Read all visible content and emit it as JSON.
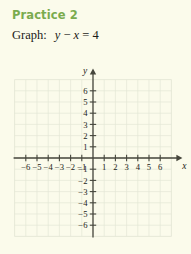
{
  "header": {
    "practice_title": "Practice 2",
    "prompt_label": "Graph:",
    "equation": {
      "lhs_var": "y",
      "operator": "−",
      "rhs_var": "x",
      "equals": "=",
      "value": "4",
      "full_text": "y − x = 4"
    }
  },
  "colors": {
    "background": "#fbfbeb",
    "title_green": "#7aab4e",
    "text": "#1c1c18",
    "axis": "#46463c",
    "grid": "#e4e6d6",
    "grid_border": "#dcdfcc"
  },
  "chart_data": {
    "type": "scatter",
    "title": "",
    "xlabel": "x",
    "ylabel": "y",
    "xlim": [
      -7,
      7
    ],
    "ylim": [
      -7,
      7
    ],
    "grid": true,
    "grid_step": 1,
    "legend": "none",
    "x_axis_label": "x",
    "y_axis_label": "y",
    "x_tick_values": [
      -6,
      -5,
      -4,
      -3,
      -2,
      -1,
      1,
      2,
      3,
      4,
      5,
      6
    ],
    "x_tick_labels": [
      "−6",
      "−5",
      "−4",
      "−3",
      "−2",
      "−1",
      "1",
      "2",
      "3",
      "4",
      "5",
      "6"
    ],
    "y_tick_values": [
      6,
      5,
      4,
      3,
      2,
      1,
      -1,
      -2,
      -3,
      -4,
      -5,
      -6
    ],
    "y_tick_labels": [
      "6",
      "5",
      "4",
      "3",
      "2",
      "1",
      "−1",
      "−2",
      "−3",
      "−4",
      "−5",
      "−6"
    ],
    "series": [],
    "values": [],
    "categories": [],
    "annotations": []
  }
}
